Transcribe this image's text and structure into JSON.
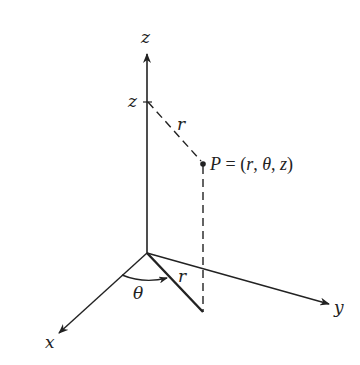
{
  "diagram": {
    "type": "cylindrical-coordinates",
    "axes": {
      "z_label": "z",
      "y_label": "y",
      "x_label": "x"
    },
    "labels": {
      "z_height": "z",
      "r_upper": "r",
      "r_lower": "r",
      "theta": "θ",
      "point_equation": "P = (r, θ, z)"
    },
    "colors": {
      "line": "#222222",
      "background": "#ffffff"
    }
  }
}
